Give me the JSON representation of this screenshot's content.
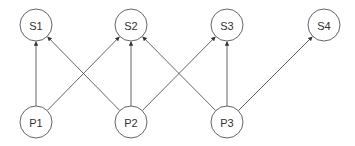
{
  "diagram": {
    "type": "bipartite-graph",
    "nodes": [
      {
        "id": "S1",
        "label": "S1",
        "row": "top"
      },
      {
        "id": "S2",
        "label": "S2",
        "row": "top"
      },
      {
        "id": "S3",
        "label": "S3",
        "row": "top"
      },
      {
        "id": "S4",
        "label": "S4",
        "row": "top"
      },
      {
        "id": "P1",
        "label": "P1",
        "row": "bottom"
      },
      {
        "id": "P2",
        "label": "P2",
        "row": "bottom"
      },
      {
        "id": "P3",
        "label": "P3",
        "row": "bottom"
      }
    ],
    "edges": [
      {
        "from": "P1",
        "to": "S1"
      },
      {
        "from": "P1",
        "to": "S2"
      },
      {
        "from": "P2",
        "to": "S1"
      },
      {
        "from": "P2",
        "to": "S2"
      },
      {
        "from": "P2",
        "to": "S3"
      },
      {
        "from": "P3",
        "to": "S2"
      },
      {
        "from": "P3",
        "to": "S3"
      },
      {
        "from": "P3",
        "to": "S4"
      }
    ],
    "edge_style": "directed-arrow",
    "colors": {
      "stroke": "#555555",
      "node_fill": "#ffffff",
      "text": "#333333"
    }
  }
}
